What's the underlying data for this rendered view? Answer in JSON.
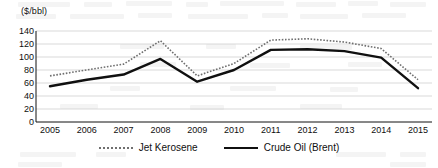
{
  "chart_data": {
    "type": "line",
    "title": "",
    "xlabel": "",
    "ylabel": "($/bbl)",
    "ylim": [
      0,
      140
    ],
    "yticks": [
      140,
      120,
      100,
      80,
      60,
      40,
      20,
      0
    ],
    "grid": true,
    "legend_position": "bottom",
    "categories": [
      "2005",
      "2006",
      "2007",
      "2008",
      "2009",
      "2010",
      "2011",
      "2012",
      "2013",
      "2014",
      "2015"
    ],
    "series": [
      {
        "name": "Jet Kerosene",
        "style": "dotted",
        "color": "#6f6f6f",
        "values": [
          71,
          80,
          89,
          125,
          71,
          90,
          126,
          128,
          123,
          113,
          65
        ]
      },
      {
        "name": "Crude Oil (Brent)",
        "style": "solid",
        "color": "#101010",
        "values": [
          55,
          65,
          73,
          97,
          62,
          80,
          111,
          112,
          109,
          99,
          52
        ]
      }
    ]
  },
  "legend": {
    "items": [
      {
        "label": "Jet Kerosene"
      },
      {
        "label": "Crude Oil (Brent)"
      }
    ]
  }
}
